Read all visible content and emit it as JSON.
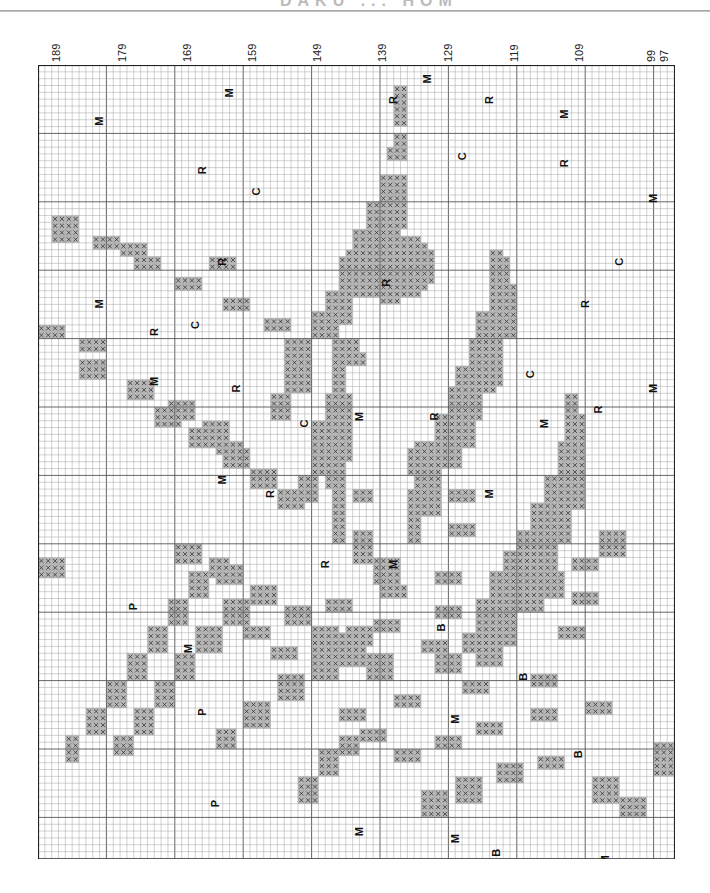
{
  "page": {
    "title_partial": "DAKU ... HOM"
  },
  "chart_data": {
    "type": "cross-stitch-pattern",
    "title": "",
    "column_labels": [
      "189",
      "179",
      "169",
      "159",
      "149",
      "139",
      "129",
      "119",
      "109",
      "99",
      "97"
    ],
    "column_range": [
      189,
      97
    ],
    "grid": {
      "cols": 93,
      "rows": 116,
      "cell_px": 6.84,
      "bold_every": 10
    },
    "symbols_legend": [
      "M",
      "R",
      "C",
      "P",
      "B"
    ],
    "stitch_symbol": "X",
    "colors": {
      "grid": "#9a9a9a",
      "grid_bold": "#555555",
      "stitch_fill": "#b8b8b8",
      "stitch_x": "#333333",
      "outline": "#222222"
    },
    "labels": [
      {
        "s": "M",
        "c": 9,
        "r": 7
      },
      {
        "s": "M",
        "c": 28,
        "r": 3
      },
      {
        "s": "M",
        "c": 57,
        "r": 1
      },
      {
        "s": "M",
        "c": 77,
        "r": 6
      },
      {
        "s": "R",
        "c": 52,
        "r": 4
      },
      {
        "s": "R",
        "c": 66,
        "r": 4
      },
      {
        "s": "R",
        "c": 24,
        "r": 14
      },
      {
        "s": "C",
        "c": 32,
        "r": 17
      },
      {
        "s": "C",
        "c": 62,
        "r": 12
      },
      {
        "s": "R",
        "c": 77,
        "r": 13
      },
      {
        "s": "M",
        "c": 90,
        "r": 18
      },
      {
        "s": "R",
        "c": 27,
        "r": 27
      },
      {
        "s": "M",
        "c": 9,
        "r": 33
      },
      {
        "s": "C",
        "c": 85,
        "r": 27
      },
      {
        "s": "R",
        "c": 51,
        "r": 30
      },
      {
        "s": "R",
        "c": 80,
        "r": 33
      },
      {
        "s": "R",
        "c": 17,
        "r": 37
      },
      {
        "s": "C",
        "c": 23,
        "r": 36
      },
      {
        "s": "M",
        "c": 17,
        "r": 44
      },
      {
        "s": "R",
        "c": 29,
        "r": 45
      },
      {
        "s": "C",
        "c": 72,
        "r": 43
      },
      {
        "s": "R",
        "c": 82,
        "r": 48
      },
      {
        "s": "M",
        "c": 90,
        "r": 45
      },
      {
        "s": "C",
        "c": 39,
        "r": 50
      },
      {
        "s": "M",
        "c": 47,
        "r": 49
      },
      {
        "s": "R",
        "c": 58,
        "r": 49
      },
      {
        "s": "M",
        "c": 74,
        "r": 50
      },
      {
        "s": "M",
        "c": 27,
        "r": 58
      },
      {
        "s": "R",
        "c": 34,
        "r": 60
      },
      {
        "s": "M",
        "c": 66,
        "r": 60
      },
      {
        "s": "R",
        "c": 42,
        "r": 70
      },
      {
        "s": "M",
        "c": 52,
        "r": 70
      },
      {
        "s": "P",
        "c": 14,
        "r": 76
      },
      {
        "s": "B",
        "c": 59,
        "r": 79
      },
      {
        "s": "M",
        "c": 22,
        "r": 82
      },
      {
        "s": "B",
        "c": 71,
        "r": 86
      },
      {
        "s": "P",
        "c": 24,
        "r": 91
      },
      {
        "s": "M",
        "c": 61,
        "r": 92
      },
      {
        "s": "B",
        "c": 79,
        "r": 97
      },
      {
        "s": "P",
        "c": 26,
        "r": 104
      },
      {
        "s": "M",
        "c": 47,
        "r": 108
      },
      {
        "s": "M",
        "c": 61,
        "r": 109
      },
      {
        "s": "B",
        "c": 67,
        "r": 111
      },
      {
        "s": "M",
        "c": 83,
        "r": 112
      }
    ],
    "stitch_runs": [
      [
        0,
        52,
        2,
        3,
        9
      ],
      [
        0,
        52,
        2,
        10,
        14
      ],
      [
        0,
        52,
        2,
        17,
        24
      ],
      [
        0,
        66,
        2,
        27,
        34
      ],
      [
        0,
        66,
        2,
        38,
        47
      ],
      [
        0,
        77,
        2,
        48,
        55
      ],
      [
        1,
        51,
        3,
        12,
        14
      ],
      [
        1,
        66,
        3,
        28,
        36
      ],
      [
        1,
        77,
        3,
        51,
        60
      ],
      [
        2,
        50,
        4,
        16,
        22
      ],
      [
        2,
        66,
        4,
        32,
        40
      ],
      [
        2,
        76,
        4,
        55,
        65
      ],
      [
        3,
        48,
        4,
        20,
        26
      ],
      [
        3,
        64,
        4,
        36,
        44
      ],
      [
        3,
        74,
        4,
        60,
        70
      ],
      [
        4,
        46,
        4,
        24,
        30
      ],
      [
        4,
        63,
        4,
        40,
        48
      ],
      [
        4,
        72,
        4,
        64,
        74
      ],
      [
        5,
        44,
        4,
        28,
        34
      ],
      [
        5,
        61,
        4,
        44,
        52
      ],
      [
        5,
        70,
        4,
        68,
        78
      ],
      [
        6,
        42,
        5,
        33,
        38
      ],
      [
        6,
        60,
        4,
        47,
        56
      ],
      [
        6,
        68,
        4,
        71,
        80
      ],
      [
        7,
        40,
        5,
        36,
        40
      ],
      [
        7,
        58,
        4,
        51,
        59
      ],
      [
        7,
        66,
        4,
        74,
        84
      ],
      [
        8,
        43,
        4,
        40,
        44
      ],
      [
        8,
        55,
        4,
        55,
        62
      ],
      [
        8,
        64,
        4,
        78,
        88
      ],
      [
        9,
        42,
        10,
        48,
        58
      ],
      [
        9,
        54,
        10,
        56,
        60
      ],
      [
        10,
        2,
        6,
        22,
        24
      ],
      [
        10,
        8,
        6,
        25,
        27
      ],
      [
        10,
        14,
        6,
        28,
        30
      ],
      [
        10,
        20,
        6,
        31,
        33
      ],
      [
        10,
        27,
        6,
        34,
        36
      ],
      [
        10,
        33,
        6,
        37,
        39
      ],
      [
        11,
        2,
        10,
        24,
        26
      ],
      [
        11,
        12,
        12,
        26,
        28
      ],
      [
        11,
        25,
        10,
        28,
        30
      ],
      [
        12,
        0,
        6,
        38,
        40
      ],
      [
        12,
        6,
        38,
        40,
        42
      ],
      [
        12,
        44,
        40,
        42,
        44
      ],
      [
        13,
        6,
        5,
        43,
        46
      ],
      [
        13,
        13,
        5,
        46,
        49
      ],
      [
        13,
        19,
        5,
        49,
        52
      ],
      [
        13,
        24,
        4,
        52,
        55
      ],
      [
        14,
        17,
        5,
        50,
        53
      ],
      [
        14,
        22,
        4,
        53,
        56
      ],
      [
        14,
        27,
        4,
        56,
        59
      ],
      [
        14,
        31,
        4,
        59,
        62
      ],
      [
        14,
        35,
        4,
        62,
        65
      ],
      [
        15,
        36,
        4,
        40,
        48
      ],
      [
        15,
        34,
        3,
        48,
        52
      ],
      [
        15,
        40,
        4,
        52,
        60
      ],
      [
        15,
        38,
        3,
        60,
        64
      ],
      [
        16,
        43,
        2,
        40,
        70
      ],
      [
        16,
        46,
        3,
        68,
        73
      ],
      [
        16,
        49,
        5,
        72,
        76
      ],
      [
        16,
        54,
        2,
        62,
        70
      ],
      [
        17,
        56,
        3,
        60,
        66
      ],
      [
        17,
        60,
        14,
        62,
        64
      ],
      [
        17,
        72,
        20,
        64,
        66
      ],
      [
        17,
        82,
        10,
        68,
        70
      ],
      [
        18,
        20,
        4,
        70,
        73
      ],
      [
        18,
        26,
        4,
        73,
        76
      ],
      [
        18,
        31,
        4,
        76,
        79
      ],
      [
        18,
        36,
        4,
        79,
        82
      ],
      [
        18,
        40,
        4,
        82,
        85
      ],
      [
        18,
        44,
        4,
        85,
        88
      ],
      [
        18,
        48,
        4,
        88,
        90
      ],
      [
        19,
        74,
        3,
        74,
        78
      ],
      [
        19,
        70,
        4,
        77,
        80
      ],
      [
        19,
        66,
        4,
        80,
        83
      ],
      [
        19,
        62,
        4,
        83,
        86
      ],
      [
        19,
        58,
        4,
        86,
        89
      ],
      [
        20,
        4,
        2,
        98,
        102
      ],
      [
        20,
        7,
        3,
        94,
        98
      ],
      [
        20,
        10,
        3,
        90,
        94
      ],
      [
        20,
        13,
        3,
        86,
        90
      ],
      [
        20,
        16,
        3,
        82,
        86
      ],
      [
        20,
        19,
        3,
        78,
        82
      ],
      [
        20,
        22,
        3,
        74,
        78
      ],
      [
        20,
        25,
        3,
        72,
        75
      ],
      [
        21,
        11,
        3,
        98,
        101
      ],
      [
        21,
        14,
        3,
        94,
        98
      ],
      [
        21,
        17,
        3,
        90,
        94
      ],
      [
        21,
        20,
        3,
        86,
        90
      ],
      [
        21,
        23,
        4,
        82,
        86
      ],
      [
        21,
        27,
        4,
        78,
        82
      ],
      [
        21,
        31,
        4,
        76,
        79
      ],
      [
        22,
        26,
        3,
        97,
        100
      ],
      [
        22,
        30,
        4,
        93,
        97
      ],
      [
        22,
        35,
        4,
        89,
        93
      ],
      [
        22,
        40,
        5,
        85,
        89
      ],
      [
        22,
        45,
        6,
        82,
        85
      ],
      [
        23,
        30,
        6,
        82,
        84
      ],
      [
        23,
        36,
        6,
        80,
        82
      ],
      [
        23,
        42,
        8,
        78,
        80
      ],
      [
        23,
        50,
        8,
        76,
        78
      ],
      [
        23,
        58,
        10,
        74,
        76
      ],
      [
        23,
        68,
        10,
        73,
        75
      ],
      [
        23,
        78,
        14,
        72,
        74
      ],
      [
        24,
        34,
        7,
        85,
        87
      ],
      [
        24,
        41,
        8,
        83,
        85
      ],
      [
        24,
        49,
        9,
        81,
        83
      ],
      [
        24,
        58,
        10,
        79,
        81
      ],
      [
        24,
        68,
        10,
        78,
        80
      ],
      [
        24,
        78,
        14,
        77,
        79
      ],
      [
        25,
        40,
        8,
        88,
        90
      ],
      [
        25,
        48,
        8,
        86,
        88
      ],
      [
        25,
        56,
        10,
        84,
        86
      ],
      [
        25,
        66,
        10,
        83,
        85
      ],
      [
        25,
        76,
        16,
        82,
        84
      ],
      [
        26,
        44,
        8,
        94,
        96
      ],
      [
        26,
        52,
        10,
        92,
        94
      ],
      [
        26,
        62,
        10,
        90,
        92
      ],
      [
        26,
        72,
        14,
        89,
        91
      ],
      [
        27,
        38,
        3,
        104,
        108
      ],
      [
        27,
        41,
        3,
        100,
        104
      ],
      [
        27,
        44,
        3,
        98,
        101
      ],
      [
        27,
        47,
        6,
        97,
        99
      ],
      [
        28,
        52,
        6,
        100,
        102
      ],
      [
        28,
        58,
        6,
        98,
        100
      ],
      [
        28,
        64,
        8,
        96,
        98
      ],
      [
        28,
        72,
        8,
        94,
        96
      ],
      [
        28,
        80,
        12,
        93,
        95
      ],
      [
        29,
        56,
        5,
        106,
        110
      ],
      [
        29,
        61,
        6,
        104,
        108
      ],
      [
        29,
        67,
        6,
        102,
        105
      ],
      [
        29,
        73,
        8,
        101,
        103
      ],
      [
        29,
        81,
        4,
        104,
        108
      ],
      [
        29,
        85,
        6,
        107,
        110
      ],
      [
        29,
        90,
        3,
        99,
        104
      ],
      [
        30,
        0,
        4,
        72,
        75
      ],
      [
        30,
        26,
        8,
        55,
        57
      ],
      [
        30,
        42,
        3,
        58,
        62
      ],
      [
        30,
        46,
        3,
        62,
        64
      ],
      [
        30,
        54,
        3,
        64,
        66
      ],
      [
        30,
        60,
        4,
        67,
        69
      ],
      [
        30,
        70,
        6,
        70,
        72
      ],
      [
        30,
        82,
        10,
        70,
        72
      ]
    ],
    "center_fill": {
      "c0": 42,
      "r0": 22,
      "c1": 60,
      "r1": 36
    }
  }
}
